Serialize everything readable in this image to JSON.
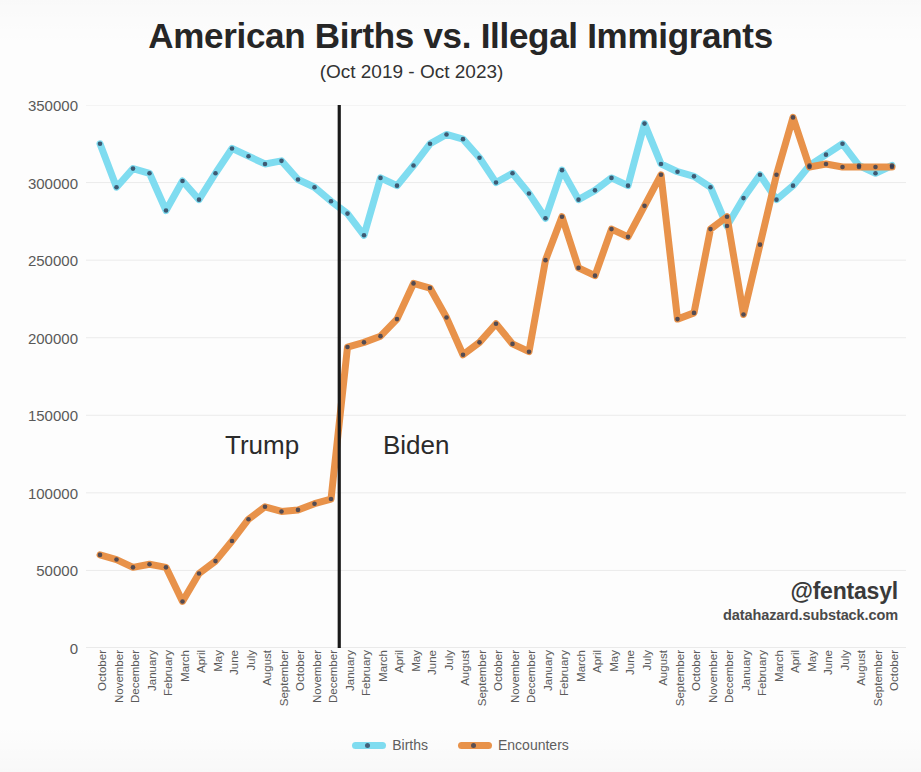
{
  "title": {
    "main": "American Births vs. Illegal Immigrants",
    "subtitle": "(Oct 2019 - Oct 2023)"
  },
  "annotations": {
    "era_left": "Trump",
    "era_right": "Biden"
  },
  "attribution": {
    "handle": "@fentasyl",
    "site": "datahazard.substack.com"
  },
  "legend": {
    "items": [
      {
        "label": "Births",
        "color": "#7fdcf0"
      },
      {
        "label": "Encounters",
        "color": "#e8924a"
      }
    ]
  },
  "colors": {
    "births": "#7fdcf0",
    "encounters": "#e8924a",
    "marker": "#2d3a54",
    "divider": "#1a1a1a",
    "grid": "#ebebeb",
    "axis_text": "#5a5a5a"
  },
  "chart_data": {
    "type": "line",
    "title": "American Births vs. Illegal Immigrants",
    "subtitle": "(Oct 2019 - Oct 2023)",
    "xlabel": "",
    "ylabel": "",
    "ylim": [
      0,
      350000
    ],
    "yticks": [
      0,
      50000,
      100000,
      150000,
      200000,
      250000,
      300000,
      350000
    ],
    "ytick_labels": [
      "0",
      "50000",
      "100000",
      "150000",
      "200000",
      "250000",
      "300000",
      "350000"
    ],
    "grid": true,
    "legend_position": "bottom",
    "markers": true,
    "categories": [
      "October",
      "November",
      "December",
      "January",
      "February",
      "March",
      "April",
      "May",
      "June",
      "July",
      "August",
      "September",
      "October",
      "November",
      "December",
      "January",
      "February",
      "March",
      "April",
      "May",
      "June",
      "July",
      "August",
      "September",
      "October",
      "November",
      "December",
      "January",
      "February",
      "March",
      "April",
      "May",
      "June",
      "July",
      "August",
      "September",
      "October",
      "November",
      "December",
      "January",
      "February",
      "March",
      "April",
      "May",
      "June",
      "July",
      "August",
      "September",
      "October"
    ],
    "series": [
      {
        "name": "Births",
        "color": "#7fdcf0",
        "values": [
          325000,
          297000,
          309000,
          306000,
          282000,
          301000,
          289000,
          306000,
          322000,
          317000,
          312000,
          314000,
          302000,
          297000,
          288000,
          280000,
          266000,
          303000,
          298000,
          311000,
          325000,
          331000,
          328000,
          316000,
          300000,
          306000,
          293000,
          277000,
          308000,
          289000,
          295000,
          303000,
          298000,
          338000,
          312000,
          307000,
          304000,
          297000,
          272000,
          290000,
          305000,
          289000,
          298000,
          311000,
          318000,
          325000,
          311000,
          306000,
          311000
        ]
      },
      {
        "name": "Encounters",
        "color": "#e8924a",
        "values": [
          60000,
          57000,
          52000,
          54000,
          52000,
          30000,
          48000,
          56000,
          69000,
          83000,
          91000,
          88000,
          89000,
          93000,
          96000,
          194000,
          197000,
          201000,
          212000,
          235000,
          232000,
          213000,
          189000,
          197000,
          209000,
          196000,
          191000,
          250000,
          278000,
          245000,
          240000,
          270000,
          265000,
          285000,
          305000,
          212000,
          216000,
          270000,
          278000,
          215000,
          260000,
          305000,
          342000,
          310000,
          312000,
          310000,
          310000,
          310000,
          310000
        ]
      }
    ],
    "divider": {
      "index": 15,
      "label_left": "Trump",
      "label_right": "Biden"
    }
  }
}
